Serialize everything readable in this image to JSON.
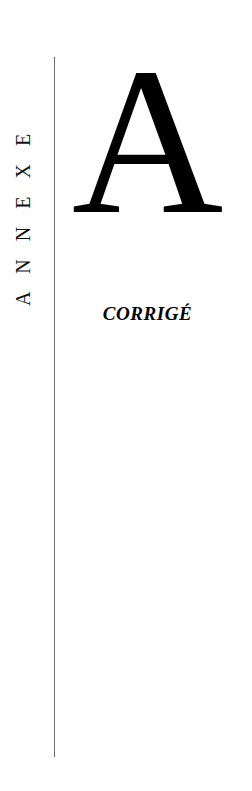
{
  "page": {
    "background_color": "#ffffff",
    "width": 252,
    "height": 791
  },
  "running_head": {
    "text": "ANNEXE",
    "orientation": "vertical-bottom-to-top",
    "color": "#111111"
  },
  "divider": {
    "name": "vertical-rule",
    "color": "#6e6e6e"
  },
  "annex": {
    "letter": "A",
    "subtitle": "CORRIGÉ",
    "letter_color": "#000000",
    "subtitle_color": "#000000"
  }
}
